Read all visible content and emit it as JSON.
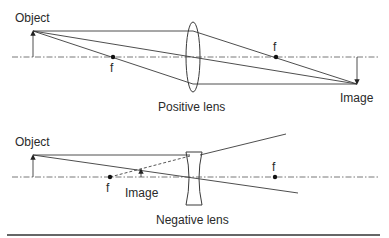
{
  "diagram": {
    "positive_lens": {
      "object_label": "Object",
      "focal_left_label": "f",
      "focal_right_label": "f",
      "lens_label": "Positive lens",
      "image_label": "Image"
    },
    "negative_lens": {
      "object_label": "Object",
      "focal_left_label": "f",
      "focal_right_label": "f",
      "image_label": "Image",
      "lens_label": "Negative lens"
    }
  }
}
